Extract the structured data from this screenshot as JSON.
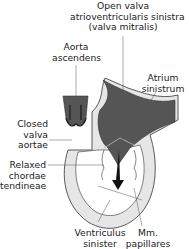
{
  "diagram": {
    "labels": {
      "mitral_open": [
        "Open valva",
        "atrioventricularis sinistra",
        "(valva mitralis)"
      ],
      "aorta": [
        "Aorta",
        "ascendens"
      ],
      "atrium": [
        "Atrium",
        "sinistrum"
      ],
      "aortic_valve": [
        "Closed",
        "valva",
        "aortae"
      ],
      "chordae": [
        "Relaxed",
        "chordae",
        "tendineae"
      ],
      "ventricle": [
        "Ventriculus",
        "sinister"
      ],
      "papillary": [
        "Mm.",
        "papillares"
      ]
    },
    "colors": {
      "blood": "#555555",
      "wall": "#e6e6e6",
      "outline": "#333333",
      "arrow": "#111111"
    }
  }
}
